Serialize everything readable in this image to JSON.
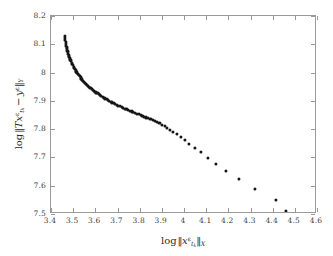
{
  "figure": {
    "background_color": "#ffffff",
    "frame_color": "#9a9a9a",
    "point_color": "#161616"
  },
  "axes": {
    "x": {
      "label_plain": "log ||x^eps_{t_k}||_X",
      "label_parts": {
        "op": "log",
        "bar_open": "‖",
        "var": "x",
        "sup": "ε",
        "sub_base": "t",
        "sub_sub": "k",
        "bar_close": "‖",
        "space_sub": "X"
      },
      "min": 3.4,
      "max": 4.6,
      "ticks": [
        "3.4",
        "3.5",
        "3.6",
        "3.7",
        "3.8",
        "3.9",
        "4",
        "4.1",
        "4.2",
        "4.3",
        "4.4",
        "4.5",
        "4.6"
      ],
      "tick_values": [
        3.4,
        3.5,
        3.6,
        3.7,
        3.8,
        3.9,
        4.0,
        4.1,
        4.2,
        4.3,
        4.4,
        4.5,
        4.6
      ]
    },
    "y": {
      "label_plain": "log ||T x^eps_{t_k} - y^eps||_Y",
      "label_parts": {
        "op": "log",
        "bar_open": "‖",
        "operator": "T",
        "var": "x",
        "sup": "ε",
        "sub_base": "t",
        "sub_sub": "k",
        "minus": "−",
        "var2": "y",
        "sup2": "ε",
        "bar_close": "‖",
        "space_sub": "Y"
      },
      "min": 7.5,
      "max": 8.2,
      "ticks": [
        "8.2",
        "8.1",
        "8",
        "7.9",
        "7.8",
        "7.7",
        "7.6",
        "7.5"
      ],
      "tick_values": [
        8.2,
        8.1,
        8.0,
        7.9,
        7.8,
        7.7,
        7.6,
        7.5
      ]
    }
  },
  "chart_data": {
    "type": "scatter",
    "title": "",
    "subtitle": "",
    "xlabel": "log ||x^eps_{t_k}||_X",
    "ylabel": "log ||T x^eps_{t_k} - y^eps||_Y",
    "xlim": [
      3.4,
      4.6
    ],
    "ylim": [
      7.5,
      8.2
    ],
    "grid": false,
    "legend": null,
    "marker": "circle",
    "marker_color": "#161616",
    "marker_size_px": 3.1,
    "series": [
      {
        "name": "L-curve",
        "points": [
          [
            3.462,
            8.129
          ],
          [
            3.4632,
            8.1215
          ],
          [
            3.4645,
            8.1145
          ],
          [
            3.4659,
            8.1078
          ],
          [
            3.4674,
            8.1012
          ],
          [
            3.469,
            8.0949
          ],
          [
            3.4707,
            8.0888
          ],
          [
            3.4725,
            8.0828
          ],
          [
            3.4744,
            8.077
          ],
          [
            3.4764,
            8.0713
          ],
          [
            3.4785,
            8.0658
          ],
          [
            3.4807,
            8.0604
          ],
          [
            3.483,
            8.0551
          ],
          [
            3.4854,
            8.0499
          ],
          [
            3.4879,
            8.0448
          ],
          [
            3.4905,
            8.0398
          ],
          [
            3.4932,
            8.0349
          ],
          [
            3.496,
            8.0301
          ],
          [
            3.4989,
            8.0254
          ],
          [
            3.5019,
            8.0208
          ],
          [
            3.505,
            8.0163
          ],
          [
            3.5082,
            8.0118
          ],
          [
            3.5115,
            8.0074
          ],
          [
            3.5149,
            8.0031
          ],
          [
            3.5184,
            7.9989
          ],
          [
            3.522,
            7.9947
          ],
          [
            3.5257,
            7.9906
          ],
          [
            3.5295,
            7.9866
          ],
          [
            3.5334,
            7.9826
          ],
          [
            3.5374,
            7.9787
          ],
          [
            3.5415,
            7.9749
          ],
          [
            3.5457,
            7.9711
          ],
          [
            3.55,
            7.9674
          ],
          [
            3.5544,
            7.9637
          ],
          [
            3.5589,
            7.9601
          ],
          [
            3.5635,
            7.9565
          ],
          [
            3.5682,
            7.953
          ],
          [
            3.573,
            7.9495
          ],
          [
            3.5779,
            7.9461
          ],
          [
            3.5829,
            7.9427
          ],
          [
            3.588,
            7.9394
          ],
          [
            3.5932,
            7.9361
          ],
          [
            3.5985,
            7.9329
          ],
          [
            3.6039,
            7.9297
          ],
          [
            3.6094,
            7.9265
          ],
          [
            3.615,
            7.9234
          ],
          [
            3.6207,
            7.9203
          ],
          [
            3.6265,
            7.9173
          ],
          [
            3.6324,
            7.9143
          ],
          [
            3.6384,
            7.9113
          ],
          [
            3.6445,
            7.9084
          ],
          [
            3.6507,
            7.9055
          ],
          [
            3.657,
            7.9026
          ],
          [
            3.6634,
            7.8998
          ],
          [
            3.6699,
            7.897
          ],
          [
            3.6765,
            7.8942
          ],
          [
            3.6832,
            7.8914
          ],
          [
            3.69,
            7.8887
          ],
          [
            3.6969,
            7.886
          ],
          [
            3.7039,
            7.8833
          ],
          [
            3.711,
            7.8806
          ],
          [
            3.7182,
            7.878
          ],
          [
            3.7255,
            7.8754
          ],
          [
            3.7329,
            7.8728
          ],
          [
            3.7404,
            7.8702
          ],
          [
            3.748,
            7.8676
          ],
          [
            3.7557,
            7.865
          ],
          [
            3.7635,
            7.8624
          ],
          [
            3.7714,
            7.8598
          ],
          [
            3.7794,
            7.8572
          ],
          [
            3.7875,
            7.8547
          ],
          [
            3.7957,
            7.8521
          ],
          [
            3.8041,
            7.8495
          ],
          [
            3.8126,
            7.8468
          ],
          [
            3.8213,
            7.8441
          ],
          [
            3.8302,
            7.8413
          ],
          [
            3.8393,
            7.8384
          ],
          [
            3.8486,
            7.8353
          ],
          [
            3.8582,
            7.8321
          ],
          [
            3.8681,
            7.8286
          ],
          [
            3.8784,
            7.8248
          ],
          [
            3.8891,
            7.8206
          ],
          [
            3.9003,
            7.816
          ],
          [
            3.9121,
            7.8108
          ],
          [
            3.9246,
            7.805
          ],
          [
            3.9379,
            7.7984
          ],
          [
            3.9522,
            7.7909
          ],
          [
            3.9677,
            7.7824
          ],
          [
            3.9846,
            7.7727
          ],
          [
            4.0033,
            7.7617
          ],
          [
            4.0242,
            7.7491
          ],
          [
            4.0478,
            7.7348
          ],
          [
            4.0749,
            7.7184
          ],
          [
            4.1065,
            7.6996
          ],
          [
            4.144,
            7.678
          ],
          [
            4.1895,
            7.653
          ],
          [
            4.246,
            7.6239
          ],
          [
            4.3185,
            7.59
          ],
          [
            4.415,
            7.5505
          ],
          [
            4.461,
            7.511
          ]
        ]
      }
    ]
  }
}
